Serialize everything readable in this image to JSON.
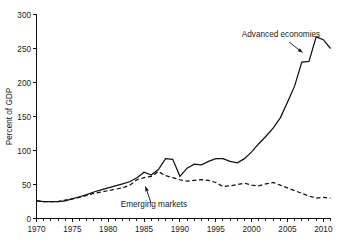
{
  "chart_data": {
    "type": "line",
    "title": "",
    "xlabel": "",
    "ylabel": "Percent of GDP",
    "xlim": [
      1970,
      2011
    ],
    "ylim": [
      0,
      300
    ],
    "grid": false,
    "legend_position": "inline-annotations",
    "y_ticks": [
      0,
      50,
      100,
      150,
      200,
      250,
      300
    ],
    "y_tick_labels": [
      "0",
      "50",
      "100",
      "150",
      "200",
      "250",
      "300"
    ],
    "x_ticks": [
      1970,
      1975,
      1980,
      1985,
      1990,
      1995,
      2000,
      2005,
      2010
    ],
    "x_tick_labels": [
      "1970",
      "1975",
      "1980",
      "1985",
      "1990",
      "1995",
      "2000",
      "2005",
      "2010"
    ],
    "x_minor_step": 1,
    "annotations": [
      {
        "name": "advanced-economies",
        "text": "Advanced economies",
        "points_to_year": 2008,
        "points_to_value": 231
      },
      {
        "name": "emerging-markets",
        "text": "Emerging markets",
        "points_to_year": 1990,
        "points_to_value": 57
      }
    ],
    "x": [
      1970,
      1971,
      1972,
      1973,
      1974,
      1975,
      1976,
      1977,
      1978,
      1979,
      1980,
      1981,
      1982,
      1983,
      1984,
      1985,
      1986,
      1987,
      1988,
      1989,
      1990,
      1991,
      1992,
      1993,
      1994,
      1995,
      1996,
      1997,
      1998,
      1999,
      2000,
      2001,
      2002,
      2003,
      2004,
      2005,
      2006,
      2007,
      2008,
      2009,
      2010,
      2011
    ],
    "series": [
      {
        "name": "Advanced economies",
        "style": "solid",
        "values": [
          26,
          25,
          25,
          25,
          26,
          29,
          32,
          35,
          39,
          42,
          45,
          48,
          51,
          54,
          60,
          68,
          64,
          72,
          88,
          87,
          62,
          74,
          80,
          79,
          84,
          88,
          88,
          84,
          82,
          88,
          98,
          110,
          121,
          133,
          148,
          171,
          195,
          230,
          231,
          267,
          263,
          250
        ]
      },
      {
        "name": "Emerging markets",
        "style": "dashed",
        "values": [
          26,
          25,
          25,
          25,
          27,
          29,
          31,
          34,
          37,
          39,
          41,
          43,
          45,
          49,
          57,
          60,
          62,
          69,
          63,
          60,
          57,
          55,
          56,
          57,
          56,
          53,
          47,
          48,
          50,
          52,
          49,
          48,
          51,
          53,
          49,
          45,
          41,
          37,
          33,
          30,
          31,
          30
        ]
      }
    ]
  }
}
